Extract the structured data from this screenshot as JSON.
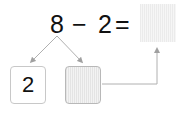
{
  "equation": {
    "minuend": "8",
    "operator": "−",
    "subtrahend": "2",
    "equals": "=",
    "answer": ""
  },
  "decomposition": {
    "left_part": "2",
    "right_part": ""
  },
  "colors": {
    "text": "#111111",
    "line": "#a8a8a8",
    "box_border": "#c8c8c8",
    "shade": "#ececec"
  }
}
